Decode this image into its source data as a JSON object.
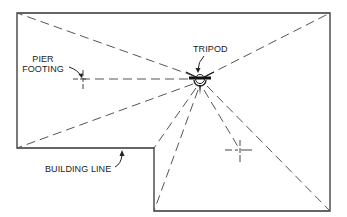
{
  "diagram": {
    "labels": {
      "tripod": "TRIPOD",
      "pier_footing_line1": "PIER",
      "pier_footing_line2": "FOOTING",
      "building_line": "BUILDING LINE"
    },
    "colors": {
      "background": "#ffffff",
      "stroke": "#333333",
      "dash": "#555555"
    },
    "building_outline": [
      [
        17,
        13
      ],
      [
        330,
        13
      ],
      [
        330,
        211
      ],
      [
        154,
        211
      ],
      [
        154,
        148
      ],
      [
        17,
        148
      ]
    ],
    "tripod_position": [
      200,
      79
    ],
    "sight_line_targets": [
      [
        17,
        13
      ],
      [
        330,
        13
      ],
      [
        17,
        148
      ],
      [
        154,
        148
      ],
      [
        154,
        211
      ],
      [
        330,
        211
      ],
      [
        83,
        79
      ],
      [
        240,
        150
      ]
    ],
    "pier_footings": [
      [
        83,
        79
      ],
      [
        240,
        150
      ]
    ]
  }
}
